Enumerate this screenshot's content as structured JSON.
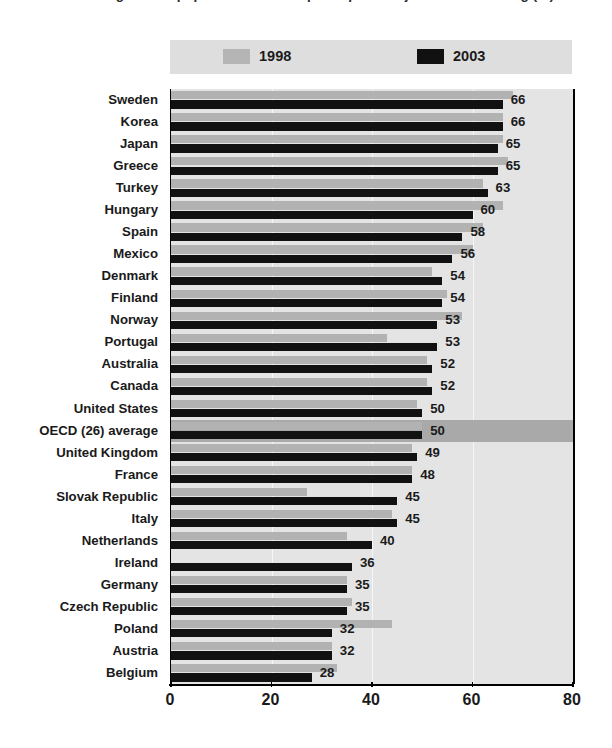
{
  "title": "Percentage of the population that has participated in job-related training (%)",
  "legend": {
    "position": "top",
    "entries": [
      {
        "label": "1998",
        "color": "#b2b2b2",
        "swatch": "light"
      },
      {
        "label": "2003",
        "color": "#111111",
        "swatch": "dark"
      }
    ]
  },
  "colors": {
    "series_1998": "#b2b2b2",
    "series_2003": "#111111",
    "plot_background": "#e4e4e4",
    "legend_background": "#dedede",
    "highlight_row": "#a9a9a9",
    "gridline": "#f6f6f6",
    "axis": "#000000"
  },
  "chart_data": {
    "type": "bar",
    "orientation": "horizontal",
    "title": "Percentage of the population that has participated in job-related training (%)",
    "xlabel": "",
    "ylabel": "",
    "xlim": [
      0,
      80
    ],
    "xticks": [
      0,
      20,
      40,
      60,
      80
    ],
    "grid": true,
    "legend_position": "top",
    "categories": [
      "Sweden",
      "Korea",
      "Japan",
      "Greece",
      "Turkey",
      "Hungary",
      "Spain",
      "Mexico",
      "Denmark",
      "Finland",
      "Norway",
      "Portugal",
      "Australia",
      "Canada",
      "United States",
      "OECD (26) average",
      "United Kingdom",
      "France",
      "Slovak Republic",
      "Italy",
      "Netherlands",
      "Ireland",
      "Germany",
      "Czech Republic",
      "Poland",
      "Austria",
      "Belgium"
    ],
    "highlighted_category": "OECD (26) average",
    "series": [
      {
        "name": "1998",
        "color": "#b2b2b2",
        "values": [
          68,
          66,
          66,
          67,
          62,
          66,
          62,
          60,
          52,
          55,
          58,
          43,
          51,
          51,
          49,
          50,
          48,
          48,
          27,
          44,
          35,
          null,
          35,
          36,
          44,
          32,
          33
        ]
      },
      {
        "name": "2003",
        "color": "#111111",
        "values": [
          66,
          66,
          65,
          65,
          63,
          60,
          58,
          56,
          54,
          54,
          53,
          53,
          52,
          52,
          50,
          50,
          49,
          48,
          45,
          45,
          40,
          36,
          35,
          35,
          32,
          32,
          28
        ]
      }
    ],
    "data_labels": [
      66,
      66,
      65,
      65,
      63,
      60,
      58,
      56,
      54,
      54,
      53,
      53,
      52,
      52,
      50,
      50,
      49,
      48,
      45,
      45,
      40,
      36,
      35,
      35,
      32,
      32,
      28
    ]
  }
}
